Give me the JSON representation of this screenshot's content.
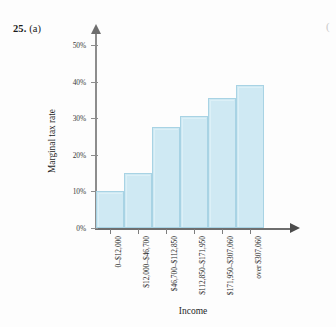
{
  "exercise": {
    "number": "25.",
    "part": "(a)",
    "edge_marker": "("
  },
  "chart_data": {
    "type": "bar",
    "title": "",
    "xlabel": "Income",
    "ylabel": "Marginal tax rate",
    "categories": [
      "0–$12,000",
      "$12,000–$46,700",
      "$46,700–$112,850",
      "$112,850–$171,950",
      "$171,950–$307,060",
      "over $307,060"
    ],
    "values": [
      10,
      15,
      27.5,
      30.5,
      35.5,
      39
    ],
    "ylim": [
      0,
      55
    ],
    "yticks": [
      0,
      10,
      20,
      30,
      40,
      50
    ],
    "ytick_labels": [
      "0%",
      "10%",
      "20%",
      "30%",
      "40%",
      "50%"
    ],
    "grid": false,
    "legend": false,
    "bar_fill": "#cfe9f3",
    "bar_stroke": "#a8d3e4",
    "axis_color": "#7d7d7d"
  }
}
